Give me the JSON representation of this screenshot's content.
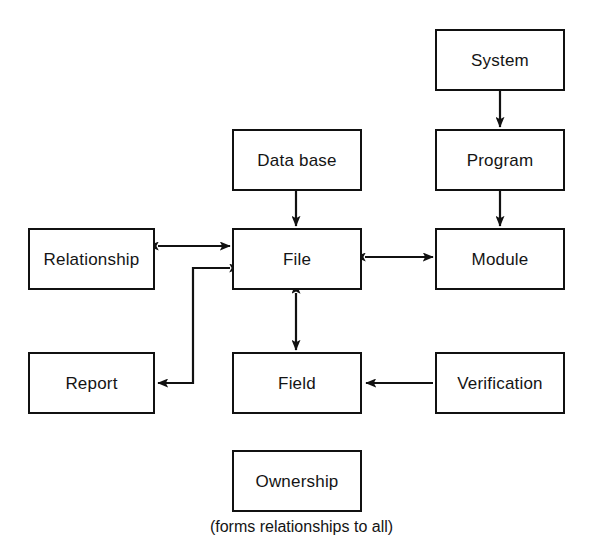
{
  "diagram": {
    "caption": "(forms relationships to all)",
    "line_color": "#111111",
    "text_color": "#141414",
    "background_color": "#ffffff",
    "nodes": [
      {
        "id": "system",
        "label": "System",
        "x": 435,
        "y": 29,
        "w": 130,
        "h": 62
      },
      {
        "id": "program",
        "label": "Program",
        "x": 435,
        "y": 129,
        "w": 130,
        "h": 62
      },
      {
        "id": "module",
        "label": "Module",
        "x": 435,
        "y": 228,
        "w": 130,
        "h": 62
      },
      {
        "id": "verification",
        "label": "Verification",
        "x": 435,
        "y": 352,
        "w": 130,
        "h": 62
      },
      {
        "id": "database",
        "label": "Data base",
        "x": 232,
        "y": 129,
        "w": 130,
        "h": 62
      },
      {
        "id": "file",
        "label": "File",
        "x": 232,
        "y": 228,
        "w": 130,
        "h": 62
      },
      {
        "id": "field",
        "label": "Field",
        "x": 232,
        "y": 352,
        "w": 130,
        "h": 62
      },
      {
        "id": "ownership",
        "label": "Ownership",
        "x": 232,
        "y": 450,
        "w": 130,
        "h": 62
      },
      {
        "id": "relationship",
        "label": "Relationship",
        "x": 28,
        "y": 228,
        "w": 127,
        "h": 62
      },
      {
        "id": "report",
        "label": "Report",
        "x": 28,
        "y": 352,
        "w": 127,
        "h": 62
      }
    ],
    "edges": [
      {
        "id": "system-to-program",
        "from": "system",
        "to": "program",
        "style": "single-arrow",
        "direction": "down"
      },
      {
        "id": "program-to-module",
        "from": "program",
        "to": "module",
        "style": "single-arrow",
        "direction": "down"
      },
      {
        "id": "database-to-file",
        "from": "database",
        "to": "file",
        "style": "single-arrow",
        "direction": "down"
      },
      {
        "id": "relationship-file",
        "from": "relationship",
        "to": "file",
        "style": "double-arrow",
        "direction": "horizontal"
      },
      {
        "id": "file-module",
        "from": "file",
        "to": "module",
        "style": "double-arrow",
        "direction": "horizontal"
      },
      {
        "id": "file-field",
        "from": "file",
        "to": "field",
        "style": "double-arrow",
        "direction": "vertical"
      },
      {
        "id": "verification-to-field",
        "from": "verification",
        "to": "field",
        "style": "single-arrow",
        "direction": "left"
      },
      {
        "id": "file-to-report",
        "from": "file",
        "to": "report",
        "style": "elbow-arrow",
        "direction": "left"
      }
    ]
  }
}
